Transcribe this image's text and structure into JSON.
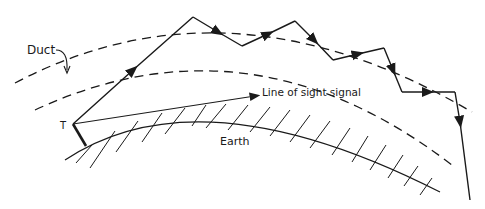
{
  "diagram": {
    "type": "tropospheric-duct-propagation",
    "labels": {
      "duct": "Duct",
      "line_of_sight": "Line of sight signal",
      "earth": "Earth",
      "transmitter": "T"
    },
    "colors": {
      "ink": "#1a1a1a",
      "background": "#ffffff"
    },
    "elements": [
      {
        "id": "outer-duct-boundary",
        "style": "dashed"
      },
      {
        "id": "inner-duct-boundary",
        "style": "dashed"
      },
      {
        "id": "ducted-ray-path",
        "style": "solid-with-arrows"
      },
      {
        "id": "line-of-sight-ray",
        "style": "solid-with-arrow"
      },
      {
        "id": "earth-surface",
        "style": "hatched-arc"
      },
      {
        "id": "transmitter-antenna",
        "style": "thick-line"
      }
    ]
  }
}
